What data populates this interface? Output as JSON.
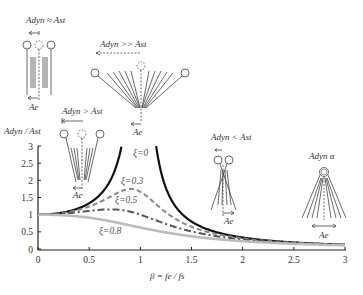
{
  "chart_data": {
    "type": "line",
    "title": "",
    "xlabel": "β = fe / fs",
    "ylabel": "Adyn / Ast",
    "xlim": [
      0,
      3
    ],
    "ylim": [
      0,
      3
    ],
    "x_ticks": [
      "0",
      "0.5",
      "1",
      "1.5",
      "2",
      "2.5",
      "3"
    ],
    "y_ticks": [
      "0",
      "0.5",
      "1",
      "1.5",
      "2",
      "2.5",
      "3"
    ],
    "grid": false,
    "legend": "inline curve labels",
    "formula": "Adyn/Ast = 1 / sqrt((1-β²)² + (2ξβ)²)",
    "series": [
      {
        "name": "ξ=0",
        "xi": 0,
        "style": "solid",
        "color": "#111111",
        "width": 2.2,
        "x": [
          0,
          0.25,
          0.5,
          0.7,
          0.8,
          0.85,
          1.15,
          1.2,
          1.3,
          1.5,
          2,
          2.5,
          3
        ],
        "values": [
          1.0,
          1.07,
          1.33,
          1.96,
          2.78,
          3.6,
          3.1,
          2.27,
          1.45,
          0.8,
          0.33,
          0.19,
          0.125
        ]
      },
      {
        "name": "ξ=0.3",
        "xi": 0.3,
        "style": "dashed",
        "color": "#888888",
        "width": 2,
        "x": [
          0,
          0.5,
          0.9,
          1.0,
          1.5,
          2,
          3
        ],
        "values": [
          1.0,
          1.25,
          1.72,
          1.67,
          0.67,
          0.32,
          0.125
        ]
      },
      {
        "name": "ξ=0.5",
        "xi": 0.5,
        "style": "dashdot",
        "color": "#555555",
        "width": 2,
        "x": [
          0,
          0.5,
          0.7,
          1.0,
          1.5,
          2,
          3
        ],
        "values": [
          1.0,
          1.1,
          1.15,
          1.0,
          0.55,
          0.3,
          0.12
        ]
      },
      {
        "name": "ξ=0.8",
        "xi": 0.8,
        "style": "solid",
        "color": "#bbbbbb",
        "width": 2.5,
        "x": [
          0,
          0.5,
          1.0,
          1.5,
          2,
          3
        ],
        "values": [
          1.0,
          0.92,
          0.63,
          0.41,
          0.25,
          0.11
        ]
      }
    ],
    "annotations": [
      {
        "text": "Adyn ≈ Ast",
        "position": "top-left",
        "sketch": "static pendulums, small offset"
      },
      {
        "text": "Adyn >> Ast",
        "position": "top-center",
        "sketch": "wide fan of pendulum positions at resonance"
      },
      {
        "text": "Adyn > Ast",
        "position": "left-middle",
        "sketch": "moderate fan"
      },
      {
        "text": "Adyn < Ast",
        "position": "right-middle",
        "sketch": "narrow crossing pendulums"
      },
      {
        "text": "Adyn α",
        "position": "right",
        "sketch": "fan with fixed top mass"
      },
      {
        "text": "Ae",
        "position": "displacement labels under sketches"
      }
    ]
  },
  "labels": {
    "y_axis": "Adyn / Ast",
    "x_axis": "β = fe / fs",
    "curve_xi0": "ξ=0",
    "curve_xi03": "ξ=0.3",
    "curve_xi05": "ξ=0.5",
    "curve_xi08": "ξ=0.8",
    "ann_equal": "Adyn ≈ Ast",
    "ann_much_greater": "Adyn >> Ast",
    "ann_greater": "Adyn > Ast",
    "ann_less": "Adyn < Ast",
    "ann_alpha": "Adyn α",
    "ae": "Ae"
  }
}
